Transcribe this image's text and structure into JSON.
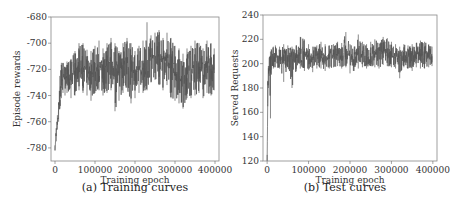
{
  "chart_data": [
    {
      "type": "line",
      "caption": "(a) Training curves",
      "title": "",
      "xlabel": "Training epoch",
      "ylabel": "Episode rewards",
      "xlim": [
        -10000,
        410000
      ],
      "ylim": [
        -790,
        -680
      ],
      "xticks": [
        0,
        100000,
        200000,
        300000,
        400000
      ],
      "xtick_labels": [
        "0",
        "100000",
        "200000",
        "300000",
        "400000"
      ],
      "yticks": [
        -780,
        -760,
        -740,
        -720,
        -700,
        -680
      ],
      "ytick_labels": [
        "-780",
        "-760",
        "-740",
        "-720",
        "-700",
        "-680"
      ],
      "grid": false,
      "line_color": "#555555",
      "series": [
        {
          "name": "Episode rewards",
          "x": [
            0,
            3000,
            6000,
            9000,
            12000,
            16000,
            20000,
            25000,
            30000,
            40000,
            50000,
            60000,
            70000,
            80000,
            90000,
            100000,
            110000,
            120000,
            130000,
            140000,
            150000,
            160000,
            170000,
            180000,
            190000,
            200000,
            210000,
            220000,
            230000,
            240000,
            250000,
            260000,
            270000,
            280000,
            290000,
            300000,
            310000,
            320000,
            330000,
            340000,
            350000,
            360000,
            370000,
            380000,
            390000,
            398000
          ],
          "values": [
            -781,
            -770,
            -760,
            -752,
            -740,
            -730,
            -725,
            -728,
            -726,
            -728,
            -722,
            -720,
            -718,
            -722,
            -725,
            -720,
            -718,
            -722,
            -716,
            -714,
            -720,
            -724,
            -718,
            -716,
            -720,
            -722,
            -718,
            -720,
            -716,
            -712,
            -710,
            -714,
            -716,
            -712,
            -718,
            -722,
            -724,
            -726,
            -722,
            -720,
            -718,
            -720,
            -722,
            -718,
            -720,
            -718
          ],
          "upper": [
            -778,
            -765,
            -755,
            -745,
            -725,
            -715,
            -715,
            -718,
            -714,
            -712,
            -706,
            -700,
            -700,
            -705,
            -706,
            -702,
            -698,
            -704,
            -700,
            -696,
            -700,
            -706,
            -700,
            -696,
            -700,
            -706,
            -702,
            -698,
            -684,
            -694,
            -692,
            -690,
            -696,
            -692,
            -696,
            -702,
            -704,
            -708,
            -704,
            -702,
            -698,
            -700,
            -704,
            -698,
            -700,
            -704
          ],
          "lower": [
            -782,
            -775,
            -766,
            -760,
            -750,
            -742,
            -738,
            -740,
            -738,
            -742,
            -740,
            -736,
            -738,
            -740,
            -744,
            -738,
            -736,
            -740,
            -738,
            -736,
            -752,
            -744,
            -738,
            -734,
            -746,
            -742,
            -738,
            -738,
            -736,
            -730,
            -728,
            -732,
            -736,
            -732,
            -742,
            -744,
            -746,
            -750,
            -742,
            -742,
            -740,
            -738,
            -742,
            -738,
            -740,
            -736
          ]
        }
      ]
    },
    {
      "type": "line",
      "caption": "(b) Test curves",
      "title": "",
      "xlabel": "Training epoch",
      "ylabel": "Served Requests",
      "xlim": [
        -10000,
        410000
      ],
      "ylim": [
        120,
        240
      ],
      "xticks": [
        0,
        100000,
        200000,
        300000,
        400000
      ],
      "xtick_labels": [
        "0",
        "100000",
        "200000",
        "300000",
        "400000"
      ],
      "yticks": [
        120,
        140,
        160,
        180,
        200,
        220,
        240
      ],
      "ytick_labels": [
        "120",
        "140",
        "160",
        "180",
        "200",
        "220",
        "240"
      ],
      "grid": false,
      "line_color": "#555555",
      "series": [
        {
          "name": "Served Requests",
          "x": [
            0,
            1500,
            3000,
            5000,
            8000,
            10000,
            15000,
            20000,
            30000,
            40000,
            50000,
            60000,
            70000,
            80000,
            90000,
            100000,
            110000,
            120000,
            130000,
            140000,
            150000,
            160000,
            170000,
            180000,
            190000,
            200000,
            210000,
            220000,
            230000,
            240000,
            250000,
            260000,
            270000,
            280000,
            290000,
            300000,
            310000,
            320000,
            330000,
            340000,
            350000,
            360000,
            370000,
            380000,
            390000,
            398000
          ],
          "values": [
            120,
            175,
            190,
            198,
            200,
            203,
            205,
            207,
            206,
            205,
            207,
            206,
            204,
            207,
            208,
            206,
            205,
            206,
            207,
            205,
            206,
            207,
            208,
            207,
            209,
            206,
            205,
            207,
            208,
            206,
            207,
            208,
            207,
            209,
            210,
            207,
            206,
            205,
            207,
            206,
            207,
            208,
            207,
            206,
            207,
            206
          ],
          "upper": [
            125,
            185,
            198,
            205,
            210,
            212,
            214,
            215,
            214,
            216,
            215,
            214,
            215,
            222,
            220,
            216,
            214,
            215,
            218,
            216,
            215,
            216,
            218,
            217,
            226,
            216,
            214,
            224,
            218,
            216,
            218,
            220,
            217,
            222,
            221,
            218,
            216,
            214,
            216,
            215,
            216,
            217,
            219,
            218,
            216,
            214
          ],
          "lower": [
            120,
            165,
            180,
            190,
            155,
            195,
            196,
            197,
            196,
            185,
            197,
            180,
            194,
            196,
            194,
            195,
            193,
            196,
            196,
            194,
            196,
            197,
            198,
            196,
            197,
            192,
            194,
            196,
            197,
            196,
            198,
            197,
            196,
            199,
            198,
            197,
            196,
            188,
            197,
            196,
            194,
            197,
            196,
            196,
            197,
            198
          ]
        }
      ]
    }
  ]
}
